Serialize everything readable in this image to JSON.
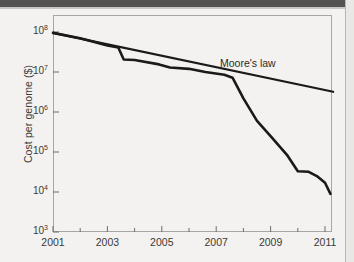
{
  "figure": {
    "background_color": "#f3f2f0",
    "frame_color": "#a8a6a3",
    "line_color": "#1a1a1a"
  },
  "chart_data": {
    "type": "line",
    "title": "",
    "xlabel": "",
    "ylabel": "Cost per genome ($)",
    "xlim": [
      2001,
      2011.3
    ],
    "ylim": [
      1000,
      100000000
    ],
    "yscale": "log",
    "grid": false,
    "legend_position": "inline-annotation",
    "x_tick_labels": [
      "2001",
      "2003",
      "2005",
      "2007",
      "2009",
      "2011"
    ],
    "x_tick_values": [
      2001,
      2003,
      2005,
      2007,
      2009,
      2011
    ],
    "x_minor_tick_values": [
      2002,
      2004,
      2006,
      2008,
      2010
    ],
    "y_tick_labels": [
      "10³",
      "10⁴",
      "10⁵",
      "10⁶",
      "10⁷",
      "10⁸"
    ],
    "y_tick_mantissas": [
      "10",
      "10",
      "10",
      "10",
      "10",
      "10"
    ],
    "y_tick_exponents": [
      "3",
      "4",
      "5",
      "6",
      "7",
      "8"
    ],
    "y_tick_values": [
      1000,
      10000,
      100000,
      1000000,
      10000000,
      100000000
    ],
    "series": [
      {
        "name": "Cost per genome",
        "annotation": "",
        "points": [
          [
            2001.0,
            95000000
          ],
          [
            2002.0,
            70000000
          ],
          [
            2003.0,
            46000000
          ],
          [
            2003.4,
            41000000
          ],
          [
            2003.6,
            20500000
          ],
          [
            2004.0,
            20000000
          ],
          [
            2004.9,
            15500000
          ],
          [
            2005.3,
            13000000
          ],
          [
            2006.0,
            12000000
          ],
          [
            2006.6,
            10000000
          ],
          [
            2007.3,
            8500000
          ],
          [
            2007.6,
            7200000
          ],
          [
            2008.0,
            2200000
          ],
          [
            2008.5,
            600000
          ],
          [
            2009.0,
            250000
          ],
          [
            2009.6,
            85000
          ],
          [
            2010.0,
            33000
          ],
          [
            2010.4,
            32000
          ],
          [
            2010.7,
            25000
          ],
          [
            2011.0,
            17000
          ],
          [
            2011.2,
            9000
          ]
        ]
      },
      {
        "name": "Moore's law",
        "annotation": "Moore's law",
        "points": [
          [
            2001.0,
            95000000
          ],
          [
            2011.3,
            3200000
          ]
        ]
      }
    ]
  }
}
